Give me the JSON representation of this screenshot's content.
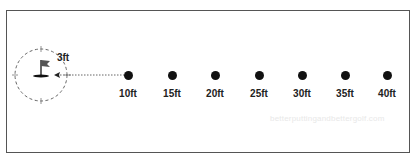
{
  "diagram": {
    "hole_zone": {
      "radius_label": "3ft",
      "icon": "golf-flag-icon"
    },
    "stations": [
      {
        "label": "10ft",
        "x": 128
      },
      {
        "label": "15ft",
        "x": 172
      },
      {
        "label": "20ft",
        "x": 215
      },
      {
        "label": "25ft",
        "x": 259
      },
      {
        "label": "30ft",
        "x": 302
      },
      {
        "label": "35ft",
        "x": 345
      },
      {
        "label": "40ft",
        "x": 387
      }
    ],
    "watermark": "betterputtingandbettergolf.com",
    "colors": {
      "ink": "#111111",
      "border": "#555555",
      "dashed": "#666666"
    }
  }
}
